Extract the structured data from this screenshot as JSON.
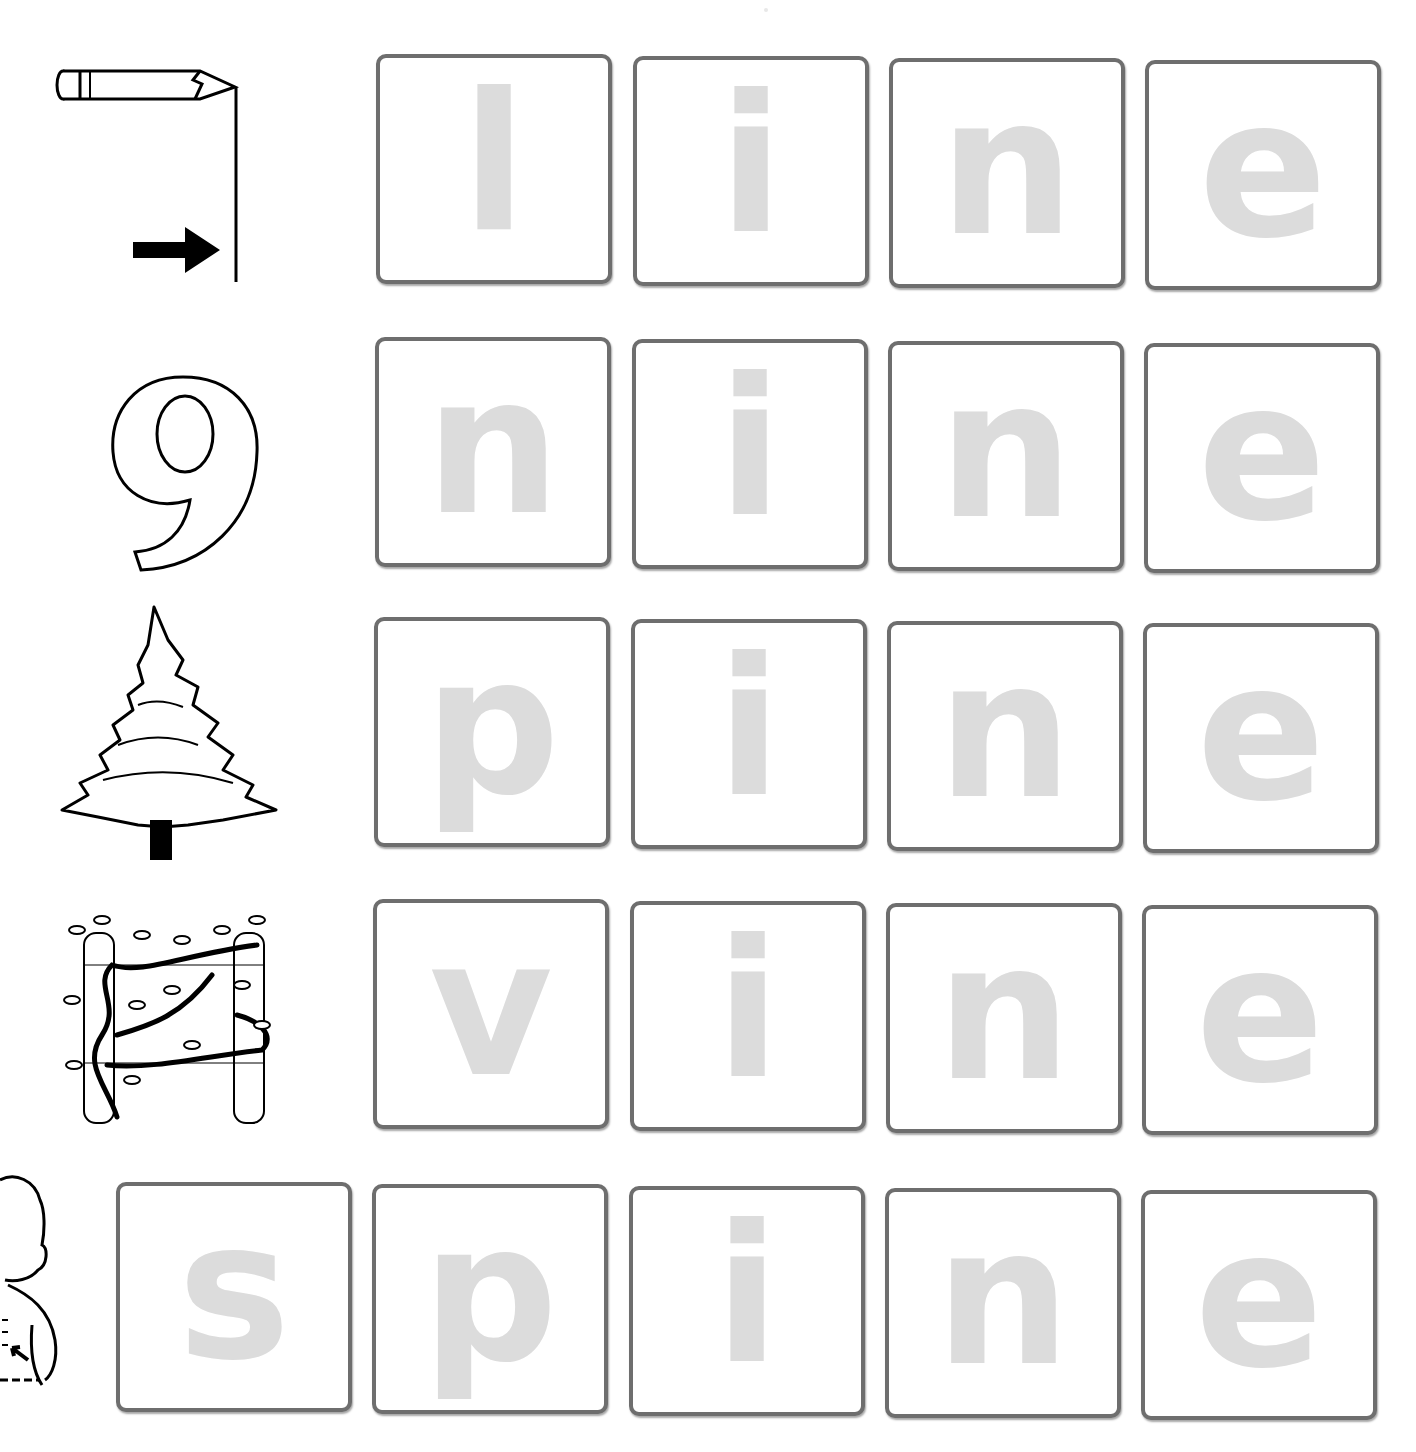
{
  "worksheet": {
    "rows": [
      {
        "picture": "line-with-pencil-and-arrow",
        "word": "line",
        "letters": [
          "l",
          "i",
          "n",
          "e"
        ]
      },
      {
        "picture": "number-nine",
        "word": "nine",
        "letters": [
          "n",
          "i",
          "n",
          "e"
        ]
      },
      {
        "picture": "pine-tree",
        "word": "pine",
        "letters": [
          "p",
          "i",
          "n",
          "e"
        ]
      },
      {
        "picture": "vine-on-posts",
        "word": "vine",
        "letters": [
          "v",
          "i",
          "n",
          "e"
        ]
      },
      {
        "picture": "boy-pointing-at-spine",
        "word": "spine",
        "letters": [
          "s",
          "p",
          "i",
          "n",
          "e"
        ]
      }
    ]
  },
  "colors": {
    "tile_border": "#6e6e6e",
    "letter_fill": "#dcdcdc",
    "background": "#ffffff"
  }
}
